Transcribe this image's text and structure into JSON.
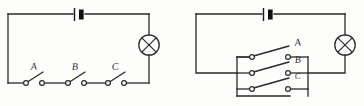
{
  "figure": {
    "background_color": "#fdfdfc",
    "ink_color": "#2a2a2a"
  },
  "circuits": [
    {
      "id": "left-circuit",
      "name": "series-switch-circuit",
      "description": "Battery, lamp and three switches connected in series",
      "components": {
        "battery": {
          "name": "battery",
          "symbol": "battery-cell"
        },
        "lamp": {
          "name": "lamp",
          "symbol": "lamp-cross-circle"
        },
        "switches": [
          {
            "label": "A",
            "state": "open"
          },
          {
            "label": "B",
            "state": "open"
          },
          {
            "label": "C",
            "state": "open"
          }
        ]
      }
    },
    {
      "id": "right-circuit",
      "name": "parallel-switch-circuit",
      "description": "Battery, lamp and three switches connected in parallel",
      "components": {
        "battery": {
          "name": "battery",
          "symbol": "battery-cell"
        },
        "lamp": {
          "name": "lamp",
          "symbol": "lamp-cross-circle"
        },
        "switches": [
          {
            "label": "A",
            "state": "open"
          },
          {
            "label": "B",
            "state": "open"
          },
          {
            "label": "C",
            "state": "open"
          }
        ]
      }
    }
  ],
  "labels": {
    "left": {
      "a": "A",
      "b": "B",
      "c": "C"
    },
    "right": {
      "a": "A",
      "b": "B",
      "c": "C"
    }
  }
}
